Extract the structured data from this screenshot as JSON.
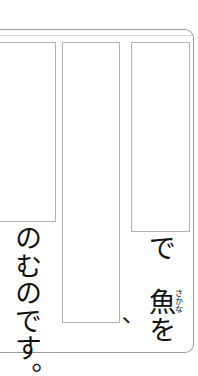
{
  "page": {
    "writing_mode": "vertical-rl",
    "language": "ja",
    "frame_color": "#9a9a9a",
    "box_border_color": "#b3b3b3",
    "text_color": "#111111",
    "background": "#ffffff"
  },
  "answer_boxes": [
    {
      "name": "box-left",
      "content": ""
    },
    {
      "name": "box-mid",
      "content": ""
    },
    {
      "name": "box-right",
      "content": ""
    }
  ],
  "text": {
    "left_column": "のむのです。",
    "right_column_particle": "で",
    "right_column_word": "魚を",
    "right_column_furigana": "さかな",
    "stray_punctuation": "、"
  }
}
